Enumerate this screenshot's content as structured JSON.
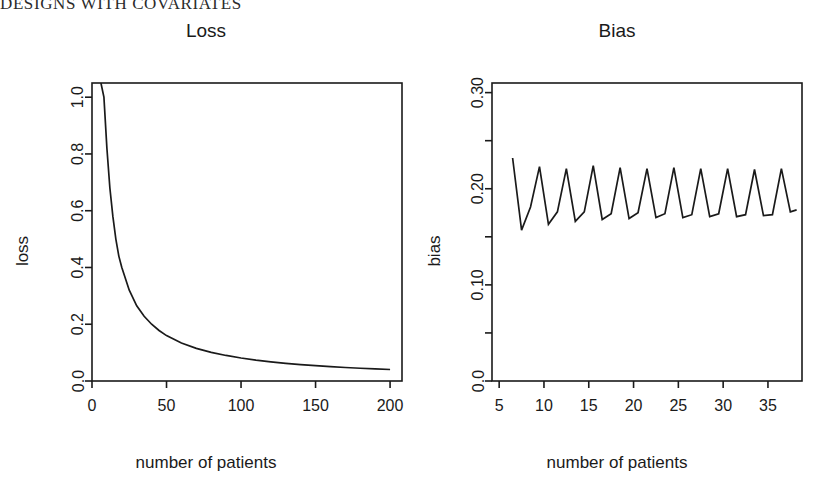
{
  "running_head": "DESIGNS WITH COVARIATES",
  "panels": [
    {
      "id": "loss",
      "title": "Loss",
      "xlabel": "number of patients",
      "ylabel": "loss"
    },
    {
      "id": "bias",
      "title": "Bias",
      "xlabel": "number of patients",
      "ylabel": "bias"
    }
  ],
  "chart_data": [
    {
      "type": "line",
      "id": "loss-plot",
      "title": "Loss",
      "xlabel": "number of patients",
      "ylabel": "loss",
      "xlim": [
        0,
        208
      ],
      "ylim": [
        0.0,
        1.05
      ],
      "xticks": [
        0,
        50,
        100,
        150,
        200
      ],
      "xtick_labels": [
        "0",
        "50",
        "100",
        "150",
        "200"
      ],
      "yticks": [
        0.0,
        0.2,
        0.4,
        0.6,
        0.8,
        1.0
      ],
      "ytick_labels": [
        "0.0",
        "0.2",
        "0.4",
        "0.6",
        "0.8",
        "1.0"
      ],
      "grid": false,
      "legend": "none",
      "frame": "box",
      "description": "Monotone decreasing hyperbolic (1/n) decay of loss versus number of patients",
      "x": [
        6,
        8,
        10,
        12,
        14,
        16,
        18,
        20,
        25,
        30,
        35,
        40,
        45,
        50,
        60,
        70,
        80,
        90,
        100,
        110,
        120,
        130,
        140,
        150,
        160,
        170,
        180,
        190,
        200
      ],
      "y": [
        1.05,
        1.0,
        0.82,
        0.68,
        0.58,
        0.5,
        0.44,
        0.4,
        0.32,
        0.265,
        0.228,
        0.2,
        0.178,
        0.16,
        0.134,
        0.115,
        0.101,
        0.09,
        0.081,
        0.0735,
        0.0675,
        0.0622,
        0.0578,
        0.054,
        0.0506,
        0.0476,
        0.045,
        0.0426,
        0.0405
      ]
    },
    {
      "type": "line",
      "id": "bias-plot",
      "title": "Bias",
      "xlabel": "number of patients",
      "ylabel": "bias",
      "xlim": [
        4.2,
        38.8
      ],
      "ylim": [
        0.0,
        0.31
      ],
      "xticks": [
        5,
        10,
        15,
        20,
        25,
        30,
        35
      ],
      "xtick_labels": [
        "5",
        "10",
        "15",
        "20",
        "25",
        "30",
        "35"
      ],
      "yticks": [
        0.0,
        0.05,
        0.1,
        0.15,
        0.2,
        0.25,
        0.3
      ],
      "ytick_labels": [
        "0.0",
        "",
        "0.10",
        "",
        "0.20",
        "",
        "0.30"
      ],
      "grid": false,
      "legend": "none",
      "frame": "box",
      "description": "Sawtooth oscillating bias versus number of patients, alternating peaks near 0.225 and troughs near 0.165, slowly decaying amplitude",
      "x": [
        6.5,
        7.5,
        8.5,
        9.5,
        10.5,
        11.5,
        12.5,
        13.5,
        14.5,
        15.5,
        16.5,
        17.5,
        18.5,
        19.5,
        20.5,
        21.5,
        22.5,
        23.5,
        24.5,
        25.5,
        26.5,
        27.5,
        28.5,
        29.5,
        30.5,
        31.5,
        32.5,
        33.5,
        34.5,
        35.5,
        36.5,
        37.5,
        38.2
      ],
      "y": [
        0.232,
        0.157,
        0.181,
        0.223,
        0.163,
        0.176,
        0.221,
        0.166,
        0.176,
        0.224,
        0.168,
        0.174,
        0.222,
        0.169,
        0.175,
        0.221,
        0.17,
        0.174,
        0.222,
        0.17,
        0.173,
        0.221,
        0.171,
        0.174,
        0.221,
        0.171,
        0.173,
        0.22,
        0.172,
        0.173,
        0.221,
        0.176,
        0.178
      ]
    }
  ]
}
